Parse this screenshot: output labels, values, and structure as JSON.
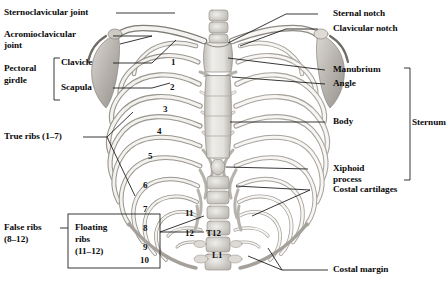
{
  "figure": {
    "colors": {
      "text": "#0a0a0a",
      "leader_line": "#1a1a1a",
      "bone_light": "#f2f1ef",
      "bone_mid": "#cfccc7",
      "bone_dark": "#9c9893",
      "background": "#ffffff"
    }
  },
  "labels": {
    "sternoclavicular_joint": "Sternoclavicular joint",
    "acromioclavicular_1": "Acromioclavicular",
    "acromioclavicular_2": "joint",
    "pectoral_1": "Pectoral",
    "pectoral_2": "girdle",
    "clavicle": "Clavicle",
    "scapula": "Scapula",
    "true_ribs": "True ribs (1–7)",
    "false_ribs_1": "False ribs",
    "false_ribs_2": "(8–12)",
    "floating_ribs_1": "Floating",
    "floating_ribs_2": "ribs",
    "floating_ribs_3": "(11–12)",
    "sternal_notch": "Sternal notch",
    "clavicular_notch": "Clavicular notch",
    "manubrium": "Manubrium",
    "angle": "Angle",
    "body": "Body",
    "xiphoid_1": "Xiphoid",
    "xiphoid_2": "process",
    "costal_cartilages": "Costal cartilages",
    "costal_margin": "Costal margin",
    "sternum": "Sternum"
  },
  "rib_numbers": {
    "r1": "1",
    "r2": "2",
    "r3": "3",
    "r4": "4",
    "r5": "5",
    "r6": "6",
    "r7": "7",
    "r8": "8",
    "r9": "9",
    "r10": "10",
    "r11": "11",
    "r12": "12"
  },
  "vertebrae": {
    "t12": "T12",
    "l1": "L1"
  }
}
